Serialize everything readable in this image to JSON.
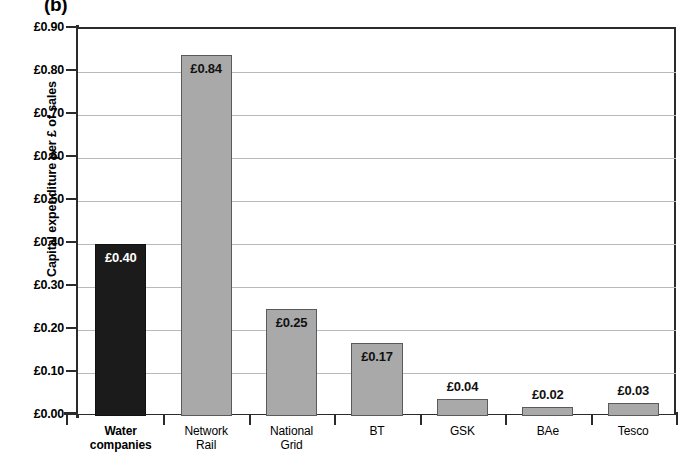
{
  "panel_label": "(b)",
  "chart_data": {
    "type": "bar",
    "title": "(b)",
    "xlabel": "",
    "ylabel": "Capital expenditure per £ of sales",
    "categories": [
      "Water companies",
      "Network Rail",
      "National Grid",
      "BT",
      "GSK",
      "BAe",
      "Tesco"
    ],
    "category_lines": [
      [
        "Water",
        "companies"
      ],
      [
        "Network",
        "Rail"
      ],
      [
        "National",
        "Grid"
      ],
      [
        "BT"
      ],
      [
        "GSK"
      ],
      [
        "BAe"
      ],
      [
        "Tesco"
      ]
    ],
    "values": [
      0.4,
      0.84,
      0.25,
      0.17,
      0.04,
      0.02,
      0.03
    ],
    "value_labels": [
      "£0.40",
      "£0.84",
      "£0.25",
      "£0.17",
      "£0.04",
      "£0.02",
      "£0.03"
    ],
    "label_positions": [
      "inside",
      "inside",
      "inside",
      "inside",
      "above",
      "above",
      "above"
    ],
    "bar_colors": [
      "#1b1b1b",
      "#a9a9a9",
      "#a9a9a9",
      "#a9a9a9",
      "#a9a9a9",
      "#a9a9a9",
      "#a9a9a9"
    ],
    "highlight_category": "Water companies",
    "ylim": [
      0.0,
      0.9
    ],
    "ytick_values": [
      0.9,
      0.8,
      0.7,
      0.6,
      0.5,
      0.4,
      0.3,
      0.2,
      0.1,
      0.0
    ],
    "ytick_labels": [
      "£0.90",
      "£0.80",
      "£0.70",
      "£0.60",
      "£0.50",
      "£0.40",
      "£0.30",
      "£0.20",
      "£0.10",
      "£0.00"
    ],
    "grid": true,
    "grid_axis": "y",
    "legend": false,
    "currency": "GBP",
    "currency_symbol": "£"
  }
}
